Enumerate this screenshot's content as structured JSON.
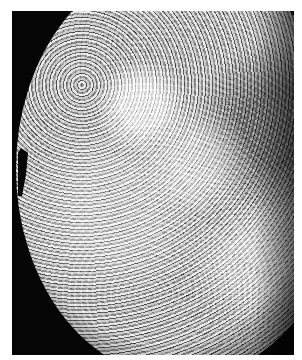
{
  "image": {
    "subject": "planet-surface-photomosaic",
    "alt": "Cratered planetary surface photomosaic against black space",
    "colors": {
      "background": "#ffffff",
      "space": "#050505",
      "surface_light": "#d8d8d8",
      "surface_dark": "#5c5c5c"
    }
  }
}
